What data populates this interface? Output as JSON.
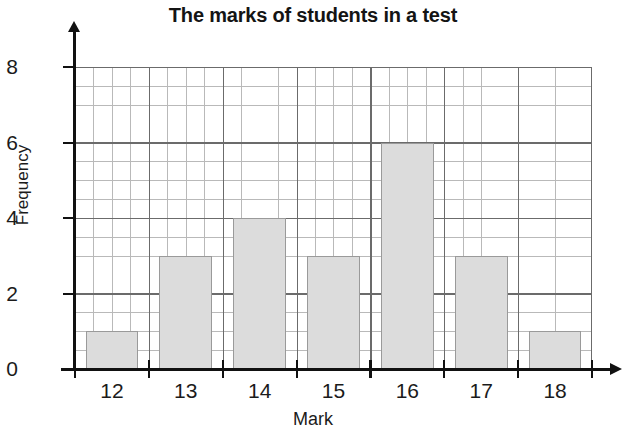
{
  "chart_data": {
    "type": "bar",
    "title": "The marks of students in a test",
    "xlabel": "Mark",
    "ylabel": "Frequency",
    "categories": [
      "12",
      "13",
      "14",
      "15",
      "16",
      "17",
      "18"
    ],
    "values": [
      1,
      3,
      4,
      3,
      6,
      3,
      1
    ],
    "series": [
      {
        "name": "Frequency",
        "values": [
          1,
          3,
          4,
          3,
          6,
          3,
          1
        ]
      }
    ],
    "xlim": [
      11.5,
      18.5
    ],
    "ylim": [
      0,
      8
    ],
    "y_ticks": [
      "0",
      "2",
      "4",
      "6",
      "8"
    ],
    "y_tick_values": [
      0,
      2,
      4,
      6,
      8
    ],
    "y_minor_step": 0.5,
    "x_minor_divisions_per_category": 4,
    "grid": true,
    "legend": "none",
    "bar_color": "#dcdcdc",
    "bar_edge_color": "#9a9a9a",
    "grid_major_color": "#6b6b6b",
    "grid_minor_color": "#b9b9b9",
    "axis_color": "#111111",
    "background_color": "#ffffff",
    "x_axis_has_arrow": true,
    "y_axis_has_arrow": true
  }
}
